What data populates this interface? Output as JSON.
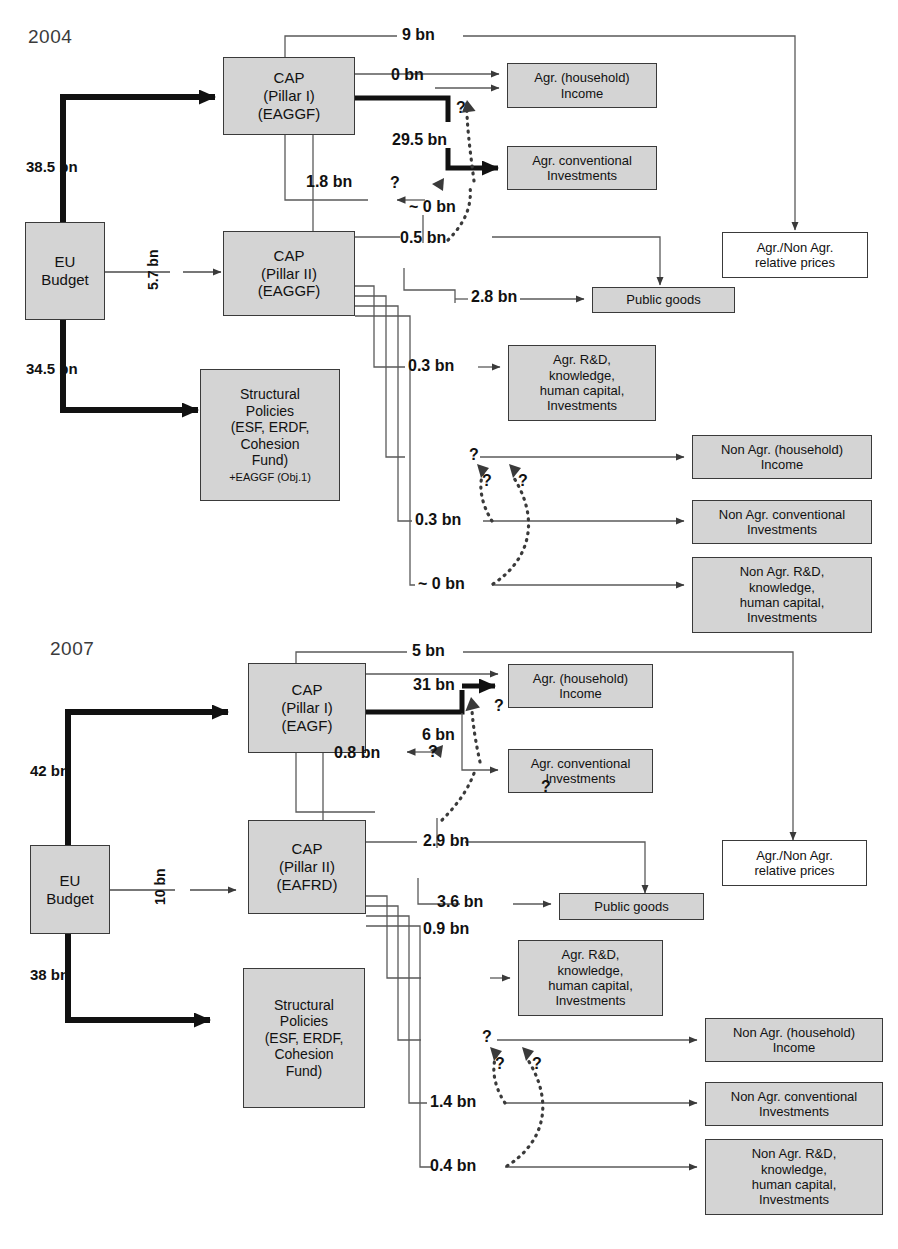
{
  "diagram": {
    "title_hidden": "",
    "sections": [
      {
        "year": "2004",
        "nodes": {
          "eu_budget": "EU\nBudget",
          "pillar1": "CAP\n(Pillar I)\n(EAGGF)",
          "pillar2": "CAP\n(Pillar II)\n(EAGGF)",
          "structural": "Structural\nPolicies\n(ESF, ERDF,\nCohesion\nFund)",
          "structural_sub": "+EAGGF (Obj.1)",
          "agr_income": "Agr. (household)\nIncome",
          "agr_conv": "Agr. conventional\nInvestments",
          "public_goods": "Public goods",
          "rel_prices": "Agr./Non Agr.\nrelative prices",
          "agr_rd": "Agr. R&D,\nknowledge,\nhuman capital,\nInvestments",
          "nonagr_income": "Non Agr. (household)\nIncome",
          "nonagr_conv": "Non Agr. conventional\nInvestments",
          "nonagr_rd": "Non Agr. R&D,\nknowledge,\nhuman capital,\nInvestments"
        },
        "flows": {
          "budget_to_pillar1": "38.5 bn",
          "budget_to_pillar2": "5.7 bn",
          "budget_to_structural": "34.5 bn",
          "pillar1_to_relprices": "9 bn",
          "pillar1_to_income_top": "0 bn",
          "pillar1_to_agrconv": "29.5 bn",
          "pillar1_to_pillar2_feedback": "1.8 bn",
          "pillar2_to_publicgoods_via_relprices": "~ 0 bn",
          "pillar2_to_0_5": "0.5 bn",
          "pillar2_to_publicgoods": "2.8 bn",
          "pillar2_to_agrrd": "0.3 bn",
          "pillar2_to_nonagr_income": "?",
          "pillar2_to_nonagr_conv": "0.3 bn",
          "pillar2_to_nonagr_rd": "~ 0 bn"
        },
        "question_marks": [
          "?",
          "?",
          "?",
          "?"
        ]
      },
      {
        "year": "2007",
        "nodes": {
          "eu_budget": "EU\nBudget",
          "pillar1": "CAP\n(Pillar I)\n(EAGF)",
          "pillar2": "CAP\n(Pillar II)\n(EAFRD)",
          "structural": "Structural\nPolicies\n(ESF, ERDF,\nCohesion\nFund)",
          "agr_income": "Agr. (household)\nIncome",
          "agr_conv": "Agr. conventional\nInvestments",
          "public_goods": "Public goods",
          "rel_prices": "Agr./Non Agr.\nrelative prices",
          "agr_rd": "Agr. R&D,\nknowledge,\nhuman capital,\nInvestments",
          "nonagr_income": "Non Agr. (household)\nIncome",
          "nonagr_conv": "Non Agr. conventional\nInvestments",
          "nonagr_rd": "Non Agr. R&D,\nknowledge,\nhuman capital,\nInvestments"
        },
        "flows": {
          "budget_to_pillar1": "42 bn",
          "budget_to_pillar2": "10 bn",
          "budget_to_structural": "38 bn",
          "pillar1_to_relprices": "5 bn",
          "pillar1_to_income": "31 bn",
          "pillar1_to_agrconv": "6 bn",
          "pillar1_to_pillar2_feedback": "0.8 bn",
          "pillar2_to_publicgoods_q": "?",
          "pillar2_to_2_9": "2.9 bn",
          "pillar2_to_publicgoods": "3.6 bn",
          "pillar2_to_agrrd": "0.9 bn",
          "pillar2_to_nonagr_income": "?",
          "pillar2_to_nonagr_conv": "1.4 bn",
          "pillar2_to_nonagr_rd": "0.4 bn"
        },
        "question_marks": [
          "?",
          "?",
          "?",
          "?"
        ]
      }
    ],
    "colors": {
      "node_fill": "#d4d4d4",
      "node_border": "#3a3a3a",
      "line": "#4a4a4a",
      "thick_line": "#111111",
      "text": "#111111",
      "year_text": "#3b3b3b",
      "background": "#ffffff"
    }
  }
}
